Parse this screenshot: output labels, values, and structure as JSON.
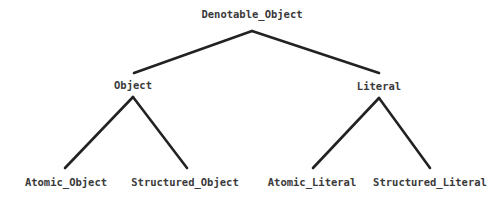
{
  "diagram": {
    "type": "tree",
    "background_color": "#ffffff",
    "edge_color": "#222222",
    "text_color": "#3a3a3a",
    "nodes": {
      "root": {
        "label": "Denotable_Object",
        "x": 252,
        "y": 18
      },
      "object": {
        "label": "Object",
        "x": 133,
        "y": 89
      },
      "literal": {
        "label": "Literal",
        "x": 379,
        "y": 90
      },
      "atomic_object": {
        "label": "Atomic_Object",
        "x": 66,
        "y": 186
      },
      "structured_object": {
        "label": "Structured_Object",
        "x": 185,
        "y": 186
      },
      "atomic_literal": {
        "label": "Atomic_Literal",
        "x": 312,
        "y": 186
      },
      "structured_literal": {
        "label": "Structured_Literal",
        "x": 430,
        "y": 186
      }
    },
    "edges": [
      {
        "name": "root-to-object",
        "from": "root",
        "to": "object",
        "x1": 252,
        "y1": 31,
        "x2": 134,
        "y2": 73
      },
      {
        "name": "root-to-literal",
        "from": "root",
        "to": "literal",
        "x1": 252,
        "y1": 31,
        "x2": 379,
        "y2": 73
      },
      {
        "name": "object-to-atomic-object",
        "from": "object",
        "to": "atomic_object",
        "x1": 133,
        "y1": 97,
        "x2": 65,
        "y2": 168
      },
      {
        "name": "object-to-structured-object",
        "from": "object",
        "to": "structured_object",
        "x1": 133,
        "y1": 97,
        "x2": 187,
        "y2": 168
      },
      {
        "name": "literal-to-atomic-literal",
        "from": "literal",
        "to": "atomic_literal",
        "x1": 379,
        "y1": 98,
        "x2": 313,
        "y2": 168
      },
      {
        "name": "literal-to-structured-literal",
        "from": "literal",
        "to": "structured_literal",
        "x1": 379,
        "y1": 98,
        "x2": 430,
        "y2": 168
      }
    ]
  }
}
